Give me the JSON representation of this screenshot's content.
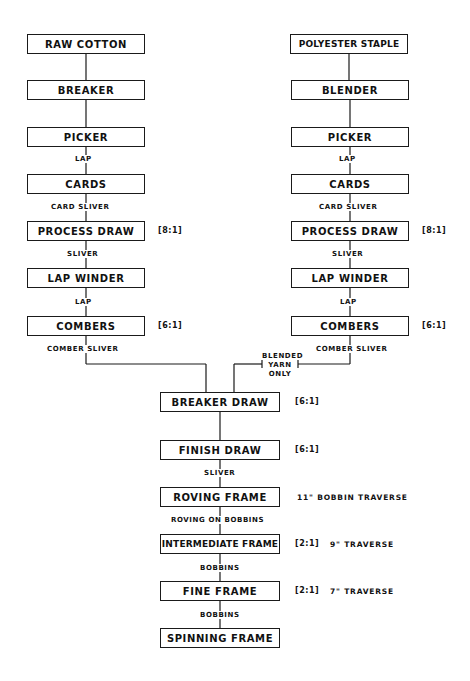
{
  "diagram": {
    "type": "process-flowchart",
    "left_chain": {
      "boxes": [
        "RAW COTTON",
        "BREAKER",
        "PICKER",
        "CARDS",
        "PROCESS DRAW",
        "LAP WINDER",
        "COMBERS"
      ],
      "links": [
        "",
        "",
        "LAP",
        "CARD SLIVER",
        "SLIVER",
        "LAP",
        "COMBER SLIVER"
      ],
      "ratios": {
        "process_draw": "[8:1]",
        "combers": "[6:1]"
      }
    },
    "right_chain": {
      "boxes": [
        "POLYESTER STAPLE",
        "BLENDER",
        "PICKER",
        "CARDS",
        "PROCESS DRAW",
        "LAP WINDER",
        "COMBERS"
      ],
      "links": [
        "",
        "",
        "LAP",
        "CARD SLIVER",
        "SLIVER",
        "LAP",
        "COMBER SLIVER"
      ],
      "ratios": {
        "process_draw": "[8:1]",
        "combers": "[6:1]"
      }
    },
    "merge_note": [
      "BLENDED",
      "YARN",
      "ONLY"
    ],
    "center_chain": {
      "boxes": [
        "BREAKER DRAW",
        "FINISH DRAW",
        "ROVING FRAME",
        "INTERMEDIATE FRAME",
        "FINE FRAME",
        "SPINNING FRAME"
      ],
      "links": [
        "",
        "SLIVER",
        "ROVING ON BOBBINS",
        "BOBBINS",
        "BOBBINS"
      ],
      "ratios": {
        "breaker_draw": "[6:1]",
        "finish_draw": "[6:1]",
        "intermediate_frame": "[2:1]",
        "fine_frame": "[2:1]"
      },
      "notes": {
        "roving_frame": "11\" BOBBIN TRAVERSE",
        "intermediate_frame": "9\" TRAVERSE",
        "fine_frame": "7\" TRAVERSE"
      }
    }
  }
}
